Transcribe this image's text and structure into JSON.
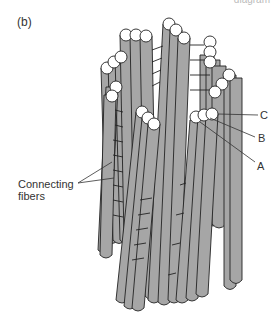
{
  "figure": {
    "panel_label": "(b)",
    "top_caption": "diagram",
    "colors": {
      "tubule_fill": "#a6a6a6",
      "outline": "#222222",
      "end_cap": "#ffffff",
      "background": "#ffffff"
    },
    "labels": {
      "connecting_fibers_line1": "Connecting",
      "connecting_fibers_line2": "fibers",
      "tubule_a": "A",
      "tubule_b": "B",
      "tubule_c": "C"
    }
  }
}
